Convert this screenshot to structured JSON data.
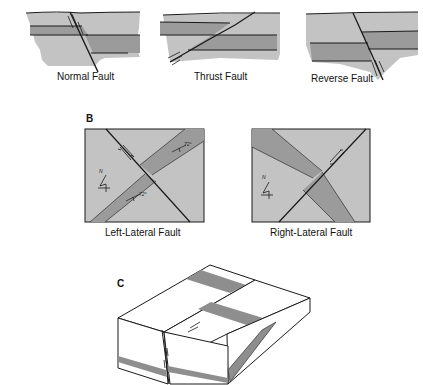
{
  "figure": {
    "colors": {
      "light_rock": "#c3c3c3",
      "dark_rock": "#9b9b9b",
      "line": "#1a1a1a",
      "block_face": "#ffffff",
      "block_band": "#8e8e8e"
    },
    "panel_a": {
      "items": [
        {
          "label": "Normal Fault"
        },
        {
          "label": "Thrust Fault"
        },
        {
          "label": "Reverse Fault"
        }
      ]
    },
    "panel_b": {
      "letter": "B",
      "items": [
        {
          "label": "Left-Lateral Fault",
          "north_symbol": "N",
          "dip_label_1": "72°",
          "dip_label_2": "72°"
        },
        {
          "label": "Right-Lateral Fault",
          "north_symbol": "N"
        }
      ]
    },
    "panel_c": {
      "letter": "C"
    }
  }
}
